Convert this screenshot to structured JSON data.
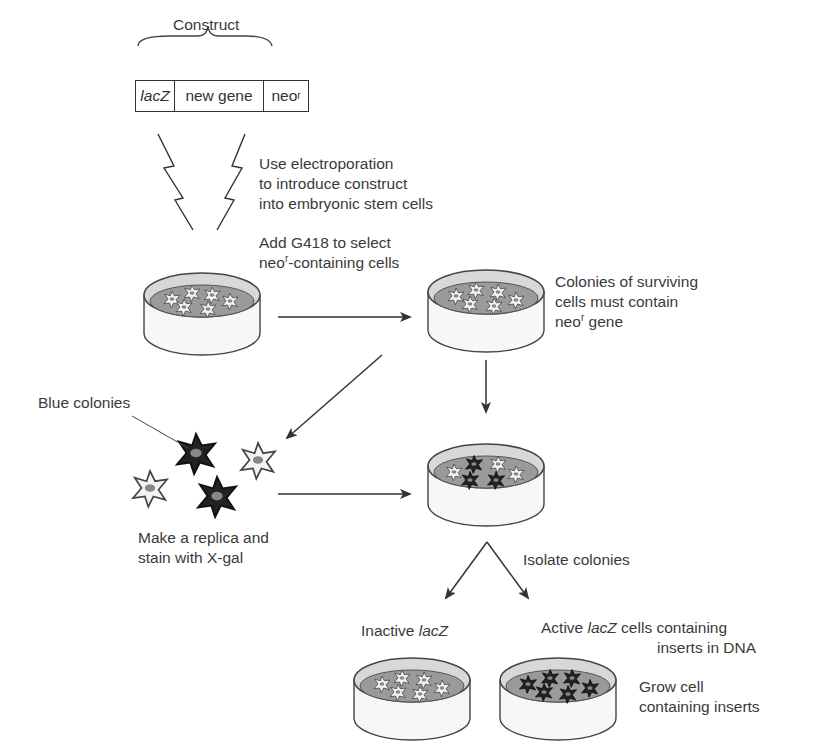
{
  "construct": {
    "title": "Construct",
    "segments": [
      {
        "text": "lacZ",
        "italic": true
      },
      {
        "text": "new gene",
        "italic": false
      },
      {
        "text": "neo",
        "sup": "r"
      }
    ]
  },
  "steps": {
    "electroporation": [
      "Use electroporation",
      "to introduce construct",
      "into embryonic stem cells"
    ],
    "select_line1": "Add G418 to select",
    "select_line2_pre": "neo",
    "select_line2_sup": "r",
    "select_line2_post": "-containing cells",
    "surviving_line1": "Colonies of surviving",
    "surviving_line2": "cells must contain",
    "surviving_line3_pre": "neo",
    "surviving_line3_sup": "r",
    "surviving_line3_post": " gene",
    "blue_colonies": "Blue colonies",
    "replica_line1": "Make a replica and",
    "replica_line2": "stain with X-gal",
    "isolate": "Isolate colonies",
    "inactive_pre": "Inactive ",
    "inactive_it": "lacZ",
    "active_pre": "Active ",
    "active_it": "lacZ",
    "active_post": " cells containing",
    "active_line2": "inserts in DNA",
    "grow_line1": "Grow cell",
    "grow_line2": "containing inserts"
  },
  "colors": {
    "line": "#333333",
    "dish_fill": "#cfcfcf",
    "medium": "#9a9a9a",
    "blue_colony": "#222222",
    "white_colony": "#f4f4f4"
  }
}
